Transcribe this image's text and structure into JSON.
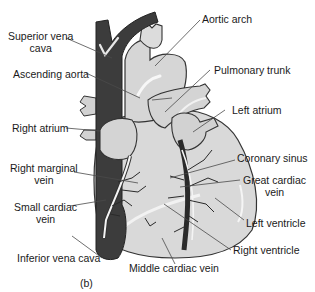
{
  "figure": {
    "panel_label": "(b)",
    "colors": {
      "heart_fill": "#d8d8d8",
      "heart_shadow": "#bdbdbd",
      "vena_cava": "#3a3a3a",
      "veins_dark": "#2a2a2a",
      "leader_line": "#4a4a4a",
      "text": "#1a1a1a"
    }
  },
  "labels": {
    "superior_vena_cava": {
      "line1": "Superior vena",
      "line2": "cava"
    },
    "ascending_aorta": "Ascending aorta",
    "right_atrium": "Right atrium",
    "right_marginal_vein": {
      "line1": "Right marginal",
      "line2": "vein"
    },
    "small_cardiac_vein": {
      "line1": "Small cardiac",
      "line2": "vein"
    },
    "inferior_vena_cava": "Inferior vena cava",
    "aortic_arch": "Aortic arch",
    "pulmonary_trunk": "Pulmonary trunk",
    "left_atrium": "Left atrium",
    "coronary_sinus": "Coronary sinus",
    "great_cardiac_vein": {
      "line1": "Great cardiac",
      "line2": "vein"
    },
    "left_ventricle": "Left ventricle",
    "right_ventricle": "Right ventricle",
    "middle_cardiac_vein": "Middle cardiac vein"
  }
}
